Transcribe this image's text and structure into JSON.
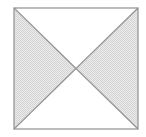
{
  "figure": {
    "name": "square-with-diagonals",
    "canvas": {
      "width": 146,
      "height": 137
    },
    "background_color": "#ffffff",
    "square": {
      "name": "outer-square",
      "left": 14,
      "top": 8,
      "right": 138,
      "bottom": 129,
      "width": 124,
      "height": 121,
      "stroke_color": "#8f8f8f",
      "stroke_width": 1.2,
      "fill_color": "#ffffff"
    },
    "diagonals": [
      {
        "name": "diagonal-top-left-to-bottom-right",
        "x1": 14,
        "y1": 8,
        "x2": 138,
        "y2": 129,
        "stroke_color": "#949494",
        "stroke_width": 1.2
      },
      {
        "name": "diagonal-top-right-to-bottom-left",
        "x1": 138,
        "y1": 8,
        "x2": 14,
        "y2": 129,
        "stroke_color": "#949494",
        "stroke_width": 1.2
      }
    ],
    "intersection_point": {
      "x": 76,
      "y": 68.5
    },
    "triangles": [
      {
        "name": "triangle-top",
        "position": "top",
        "points": "14,8 138,8 76,68.5",
        "fill_color": "#ffffff",
        "shaded": false
      },
      {
        "name": "triangle-right",
        "position": "right",
        "points": "138,8 138,129 76,68.5",
        "fill_color": "#e4e4e4",
        "shaded": true
      },
      {
        "name": "triangle-bottom",
        "position": "bottom",
        "points": "14,129 138,129 76,68.5",
        "fill_color": "#ffffff",
        "shaded": false
      },
      {
        "name": "triangle-left",
        "position": "left",
        "points": "14,8 14,129 76,68.5",
        "fill_color": "#e4e4e4",
        "shaded": true
      }
    ],
    "shading": {
      "pattern": "halftone-dot",
      "dot_color": "#d2d2d2",
      "base_color": "#ededed",
      "spacing": 2
    }
  }
}
